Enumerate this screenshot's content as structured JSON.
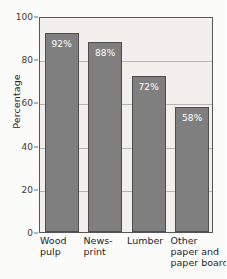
{
  "chart_data": {
    "type": "bar",
    "title": "",
    "xlabel": "",
    "ylabel": "Percentage",
    "ylim": [
      0,
      100
    ],
    "ytick_step": 20,
    "grid": true,
    "legend": false,
    "categories": [
      "Wood pulp",
      "News-print",
      "Lumber",
      "Other paper and paper board"
    ],
    "category_lines": [
      [
        "Wood",
        "pulp"
      ],
      [
        "News-",
        "print"
      ],
      [
        "Lumber"
      ],
      [
        "Other",
        "paper and",
        "paper board"
      ]
    ],
    "values": [
      92,
      88,
      72,
      58
    ],
    "data_labels": [
      "92%",
      "88%",
      "72%",
      "58%"
    ],
    "yticks": [
      0,
      20,
      40,
      60,
      80,
      100
    ],
    "ytick_labels": [
      "0",
      "20",
      "40",
      "60",
      "80",
      "100"
    ],
    "colors": {
      "bar_fill": "#7f7f7f",
      "bar_border": "#4d4d4d",
      "plot_background": "#f1f0ed",
      "page_background": "#fbfbfa",
      "gridline": "#b5b5b3",
      "axis_line": "#56565a",
      "data_label_text": "#ffffff",
      "tick_text": "#3a3a3a"
    }
  }
}
